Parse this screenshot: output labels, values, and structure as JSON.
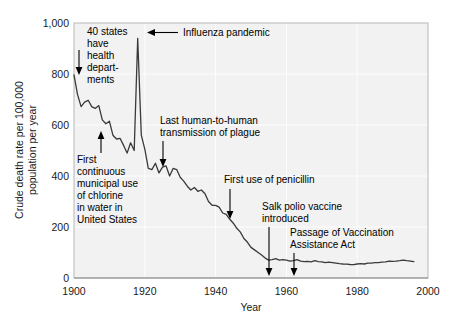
{
  "chart_data": {
    "type": "line",
    "title": "",
    "xlabel": "Year",
    "ylabel": "Crude death rate per 100,000 population per year",
    "xlim": [
      1900,
      2000
    ],
    "ylim": [
      0,
      1000
    ],
    "xticks": [
      "1900",
      "1920",
      "1940",
      "1960",
      "1980",
      "2000"
    ],
    "xtick_values": [
      1900,
      1920,
      1940,
      1960,
      1980,
      2000
    ],
    "yticks": [
      "0",
      "200",
      "400",
      "600",
      "800",
      "1,000"
    ],
    "ytick_values": [
      0,
      200,
      400,
      600,
      800,
      1000
    ],
    "grid": true,
    "legend": "none",
    "series": [
      {
        "name": "Crude death rate from infectious diseases",
        "x": [
          1900,
          1901,
          1902,
          1903,
          1904,
          1905,
          1906,
          1907,
          1908,
          1909,
          1910,
          1911,
          1912,
          1913,
          1914,
          1915,
          1916,
          1917,
          1918,
          1919,
          1920,
          1921,
          1922,
          1923,
          1924,
          1925,
          1926,
          1927,
          1928,
          1929,
          1930,
          1931,
          1932,
          1933,
          1934,
          1935,
          1936,
          1937,
          1938,
          1939,
          1940,
          1941,
          1942,
          1943,
          1944,
          1945,
          1946,
          1947,
          1948,
          1949,
          1950,
          1951,
          1952,
          1953,
          1954,
          1955,
          1956,
          1957,
          1958,
          1959,
          1960,
          1961,
          1962,
          1963,
          1964,
          1965,
          1966,
          1967,
          1968,
          1969,
          1970,
          1971,
          1972,
          1973,
          1974,
          1975,
          1976,
          1977,
          1978,
          1979,
          1980,
          1981,
          1982,
          1983,
          1984,
          1985,
          1986,
          1987,
          1988,
          1989,
          1990,
          1991,
          1992,
          1993,
          1994,
          1995,
          1996
        ],
        "values": [
          797,
          720,
          672,
          690,
          697,
          672,
          665,
          676,
          620,
          605,
          615,
          560,
          545,
          548,
          520,
          490,
          530,
          500,
          940,
          560,
          505,
          430,
          425,
          450,
          412,
          435,
          440,
          400,
          430,
          425,
          395,
          380,
          360,
          345,
          355,
          340,
          345,
          330,
          300,
          285,
          285,
          278,
          255,
          250,
          230,
          215,
          195,
          180,
          155,
          140,
          120,
          110,
          100,
          90,
          78,
          70,
          72,
          76,
          70,
          72,
          70,
          66,
          68,
          72,
          66,
          64,
          65,
          63,
          68,
          64,
          63,
          60,
          62,
          60,
          58,
          56,
          55,
          54,
          53,
          52,
          55,
          56,
          55,
          58,
          58,
          60,
          60,
          62,
          63,
          66,
          65,
          66,
          68,
          70,
          68,
          66,
          64
        ]
      }
    ],
    "annotations": [
      {
        "id": "health-departments",
        "lines": [
          "40 states",
          "have",
          "health",
          "depart-",
          "ments"
        ],
        "year": 1900,
        "value": 797,
        "arrow": "down"
      },
      {
        "id": "influenza-pandemic",
        "lines": [
          "Influenza pandemic"
        ],
        "year": 1918,
        "value": 940,
        "arrow": "left"
      },
      {
        "id": "chlorine-water",
        "lines": [
          "First",
          "continuous",
          "municipal use",
          "of chlorine",
          "in water in",
          "United States"
        ],
        "year": 1908,
        "value": 500,
        "arrow": "up"
      },
      {
        "id": "plague-transmission",
        "lines": [
          "Last human-to-human",
          "transmission of plague"
        ],
        "year": 1925,
        "value": 435,
        "arrow": "down"
      },
      {
        "id": "penicillin",
        "lines": [
          "First use of penicillin"
        ],
        "year": 1943,
        "value": 250,
        "arrow": "down"
      },
      {
        "id": "salk-polio-vaccine",
        "lines": [
          "Salk polio vaccine",
          "introduced"
        ],
        "year": 1955,
        "value": 70,
        "arrow": "down"
      },
      {
        "id": "vaccination-assistance-act",
        "lines": [
          "Passage of Vaccination",
          "Assistance Act"
        ],
        "year": 1962,
        "value": 68,
        "arrow": "down"
      }
    ]
  },
  "labels": {
    "y_axis_line1": "Crude death rate per 100,000",
    "y_axis_line2": "population per year",
    "x_axis_title": "Year",
    "ytick_1000": "1,000",
    "ytick_800": "800",
    "ytick_600": "600",
    "ytick_400": "400",
    "ytick_200": "200",
    "ytick_0": "0",
    "xtick_1900": "1900",
    "xtick_1920": "1920",
    "xtick_1940": "1940",
    "xtick_1960": "1960",
    "xtick_1980": "1980",
    "xtick_2000": "2000",
    "anno_health_1": "40 states",
    "anno_health_2": "have",
    "anno_health_3": "health",
    "anno_health_4": "depart-",
    "anno_health_5": "ments",
    "anno_influenza": "Influenza pandemic",
    "anno_chlorine_1": "First",
    "anno_chlorine_2": "continuous",
    "anno_chlorine_3": "municipal use",
    "anno_chlorine_4": "of chlorine",
    "anno_chlorine_5": "in water in",
    "anno_chlorine_6": "United States",
    "anno_plague_1": "Last human-to-human",
    "anno_plague_2": "transmission of plague",
    "anno_penicillin": "First use of penicillin",
    "anno_salk_1": "Salk polio vaccine",
    "anno_salk_2": "introduced",
    "anno_vaccact_1": "Passage of Vaccination",
    "anno_vaccact_2": "Assistance Act"
  },
  "colors": {
    "line": "#3a3a3a",
    "plot_background": "#f2f2f2",
    "gridline": "#ffffff",
    "text": "#000000",
    "page_background": "#ffffff"
  }
}
